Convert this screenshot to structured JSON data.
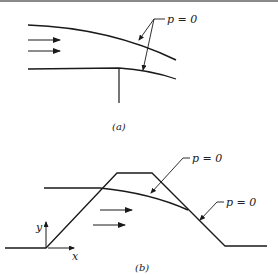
{
  "figure_a": {
    "caption": "(a)",
    "label_upper": "p = 0",
    "description": "Flow from a channel: free jet with upper free streamline and lower streamline separating at wall end"
  },
  "figure_b": {
    "caption": "(b)",
    "label_top": "p = 0",
    "label_right": "p = 0",
    "axis_x": "x",
    "axis_y": "y",
    "description": "Flow over a trapezoidal obstacle with free surface p = 0"
  },
  "colors": {
    "line": "#1a1a1a",
    "background": "#ffffff",
    "top_border": "#8a8a8a"
  }
}
